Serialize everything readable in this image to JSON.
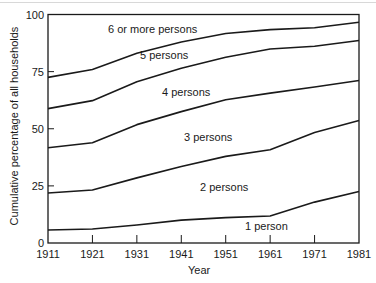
{
  "chart_data": {
    "type": "line",
    "title": "",
    "xlabel": "Year",
    "ylabel": "Cumulative percentage of all households",
    "x": [
      1911,
      1921,
      1931,
      1941,
      1951,
      1961,
      1971,
      1981
    ],
    "ylim": [
      0,
      100
    ],
    "yticks": [
      0,
      25,
      50,
      75,
      100
    ],
    "grid": false,
    "legend": "inline labels",
    "series": [
      {
        "name": "1 person",
        "values": [
          5.7,
          6.1,
          7.9,
          10.0,
          11.1,
          11.8,
          17.9,
          22.5
        ]
      },
      {
        "name": "2 persons",
        "values": [
          21.9,
          23.2,
          28.5,
          33.5,
          37.9,
          40.8,
          48.4,
          53.6
        ]
      },
      {
        "name": "3 persons",
        "values": [
          41.7,
          43.9,
          51.8,
          57.5,
          62.7,
          65.6,
          68.3,
          71.1
        ]
      },
      {
        "name": "4 persons",
        "values": [
          58.8,
          62.3,
          70.6,
          76.5,
          81.3,
          84.9,
          86.1,
          88.6
        ]
      },
      {
        "name": "5 persons",
        "values": [
          72.5,
          75.9,
          83.0,
          88.0,
          91.7,
          93.4,
          94.2,
          96.6
        ]
      },
      {
        "name": "6 or more persons",
        "values": [
          100,
          100,
          100,
          100,
          100,
          100,
          100,
          100
        ]
      }
    ],
    "annotations": [
      "6 or more persons",
      "5 persons",
      "4 persons",
      "3 persons",
      "2 persons",
      "1 person"
    ]
  },
  "labels": {
    "y_axis": "Cumulative percentage of all households",
    "x_axis": "Year",
    "band_6": "6 or more persons",
    "band_5": "5 persons",
    "band_4": "4 persons",
    "band_3": "3 persons",
    "band_2": "2 persons",
    "band_1": "1 person"
  }
}
